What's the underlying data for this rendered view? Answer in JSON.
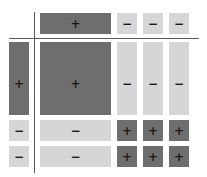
{
  "diagram": {
    "title": "",
    "colors": {
      "positive": "#6e6e6e",
      "negative": "#d6d6d6",
      "axis": "#5a5a5a"
    },
    "top_row": [
      {
        "sign": "+",
        "tone": "dark"
      },
      {
        "sign": "−",
        "tone": "light"
      },
      {
        "sign": "−",
        "tone": "light"
      },
      {
        "sign": "−",
        "tone": "light"
      }
    ],
    "left_col": [
      {
        "sign": "+",
        "tone": "dark"
      },
      {
        "sign": "−",
        "tone": "light"
      },
      {
        "sign": "−",
        "tone": "light"
      }
    ],
    "matrix": [
      [
        {
          "sign": "+"
        },
        {
          "sign": "−"
        },
        {
          "sign": "−"
        },
        {
          "sign": "−"
        }
      ],
      [
        {
          "sign": "−"
        },
        {
          "sign": "+"
        },
        {
          "sign": "+"
        },
        {
          "sign": "+"
        }
      ],
      [
        {
          "sign": "−"
        },
        {
          "sign": "+"
        },
        {
          "sign": "+"
        },
        {
          "sign": "+"
        }
      ]
    ]
  }
}
